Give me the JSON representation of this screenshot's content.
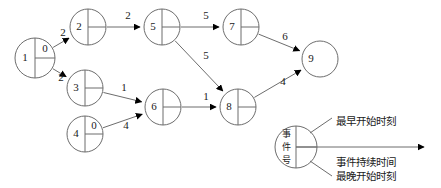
{
  "diagram": {
    "type": "aoe-activity-network",
    "nodes": [
      {
        "id": "n1",
        "label": "1",
        "earliest": "0",
        "cx": 35,
        "cy": 58,
        "r": 20,
        "divider": "both"
      },
      {
        "id": "n2",
        "label": "2",
        "earliest": "",
        "cx": 88,
        "cy": 27,
        "r": 18,
        "divider": "both"
      },
      {
        "id": "n3",
        "label": "3",
        "earliest": "",
        "cx": 85,
        "cy": 88,
        "r": 18,
        "divider": "both"
      },
      {
        "id": "n4",
        "label": "4",
        "earliest": "0",
        "cx": 85,
        "cy": 134,
        "r": 18,
        "divider": "both"
      },
      {
        "id": "n5",
        "label": "5",
        "earliest": "",
        "cx": 162,
        "cy": 27,
        "r": 18,
        "divider": "both"
      },
      {
        "id": "n6",
        "label": "6",
        "earliest": "",
        "cx": 163,
        "cy": 107,
        "r": 18,
        "divider": "both"
      },
      {
        "id": "n7",
        "label": "7",
        "earliest": "",
        "cx": 241,
        "cy": 27,
        "r": 18,
        "divider": "both"
      },
      {
        "id": "n8",
        "label": "8",
        "earliest": "",
        "cx": 238,
        "cy": 107,
        "r": 18,
        "divider": "both"
      },
      {
        "id": "n9",
        "label": "9",
        "earliest": "",
        "cx": 320,
        "cy": 59,
        "r": 18,
        "divider": "none"
      }
    ],
    "edges": [
      {
        "from": "n1",
        "to": "n2",
        "weight": "2",
        "lx": 63,
        "ly": 33
      },
      {
        "from": "n1",
        "to": "n3",
        "weight": "2",
        "lx": 61,
        "ly": 78
      },
      {
        "from": "n2",
        "to": "n5",
        "weight": "2",
        "lx": 128,
        "ly": 16
      },
      {
        "from": "n5",
        "to": "n7",
        "weight": "5",
        "lx": 206,
        "ly": 16
      },
      {
        "from": "n5",
        "to": "n8",
        "weight": "5",
        "lx": 206,
        "ly": 56
      },
      {
        "from": "n3",
        "to": "n6",
        "weight": "1",
        "lx": 124,
        "ly": 88
      },
      {
        "from": "n4",
        "to": "n6",
        "weight": "4",
        "lx": 126,
        "ly": 126
      },
      {
        "from": "n6",
        "to": "n8",
        "weight": "1",
        "lx": 206,
        "ly": 97
      },
      {
        "from": "n7",
        "to": "n9",
        "weight": "6",
        "lx": 285,
        "ly": 37
      },
      {
        "from": "n8",
        "to": "n9",
        "weight": "4",
        "lx": 283,
        "ly": 82
      }
    ]
  },
  "legend": {
    "node_label_chars": [
      "事",
      "件",
      "号"
    ],
    "earliest_start": "最早开始时刻",
    "duration": "事件持续时间",
    "latest_start": "最晚开始时刻"
  }
}
